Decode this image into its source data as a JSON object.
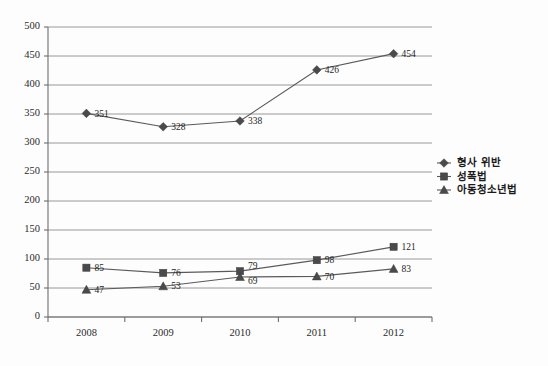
{
  "chart_data": {
    "type": "line",
    "title": "",
    "subtitle": "",
    "xlabel": "",
    "ylabel": "",
    "categories": [
      "2008",
      "2009",
      "2010",
      "2011",
      "2012"
    ],
    "ylim": [
      0,
      500
    ],
    "ytick_step": 50,
    "yticks": [
      "0",
      "50",
      "100",
      "150",
      "200",
      "250",
      "300",
      "350",
      "400",
      "450",
      "500"
    ],
    "grid": true,
    "legend_position": "right",
    "series": [
      {
        "name": "형사 위반",
        "marker": "diamond",
        "values": [
          351,
          328,
          338,
          426,
          454
        ],
        "labels": [
          "351",
          "328",
          "338",
          "426",
          "454"
        ]
      },
      {
        "name": "성폭법",
        "marker": "square",
        "values": [
          85,
          76,
          79,
          98,
          121
        ],
        "labels": [
          "85",
          "76",
          "79",
          "98",
          "121"
        ]
      },
      {
        "name": "아동청소년법",
        "marker": "triangle",
        "values": [
          47,
          53,
          69,
          70,
          83
        ],
        "labels": [
          "47",
          "53",
          "69",
          "70",
          "83"
        ]
      }
    ]
  },
  "colors": {
    "background": "#fdfdfd",
    "gridline": "#8c8c8c",
    "axis": "#6e6e6e",
    "series_line": "#5a5a5a",
    "marker": "#4a4a4a",
    "text": "#1f1f1f"
  }
}
